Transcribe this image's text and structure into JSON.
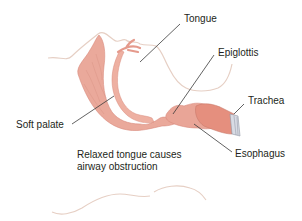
{
  "diagram": {
    "labels": {
      "tongue": "Tongue",
      "epiglottis": "Epiglottis",
      "trachea": "Trachea",
      "soft_palate": "Soft palate",
      "esophagus": "Esophagus"
    },
    "caption": {
      "line1": "Relaxed tongue causes",
      "line2": "airway obstruction"
    },
    "colors": {
      "tissue": "#e9a597",
      "tissue_light": "#f2c4b8",
      "tissue_dark": "#d98a7c",
      "outline": "#e6cfc4",
      "leader_line": "#3a3a3a",
      "cartilage": "#c9ced8",
      "text": "#231f20"
    }
  }
}
